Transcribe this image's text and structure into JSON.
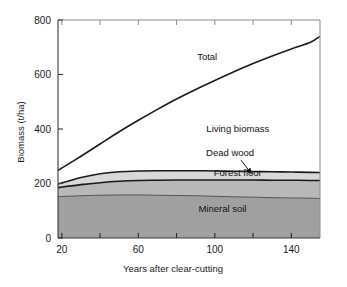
{
  "chart_data": {
    "type": "area",
    "title": "",
    "subtitle": "",
    "xlabel": "Years after clear-cutting",
    "ylabel": "Biomass (t/ha)",
    "xlim": [
      18,
      155
    ],
    "ylim": [
      0,
      800
    ],
    "grid": false,
    "legend_position": "inline-annotations",
    "x_ticks_major": [
      20,
      60,
      100,
      140
    ],
    "x_ticks_minor": [
      40,
      80,
      120
    ],
    "x_tick_labels": [
      "20",
      "60",
      "100",
      "140"
    ],
    "y_ticks_major": [
      0,
      200,
      400,
      600,
      800
    ],
    "y_tick_labels": [
      "0",
      "200",
      "400",
      "600",
      "800"
    ],
    "x": [
      18,
      30,
      40,
      50,
      60,
      70,
      80,
      90,
      100,
      110,
      120,
      130,
      140,
      150,
      155
    ],
    "series": [
      {
        "name": "Mineral soil",
        "label": "Mineral soil",
        "color": "#a0a0a0",
        "stacked": true,
        "values": [
          152,
          155,
          157,
          158,
          158,
          157,
          156,
          155,
          153,
          151,
          150,
          148,
          147,
          146,
          145
        ]
      },
      {
        "name": "Forest floor",
        "label": "Forest floor",
        "color": "#b8b8b8",
        "stacked": true,
        "cumulative": [
          185,
          196,
          203,
          208,
          211,
          212,
          213,
          213,
          213,
          213,
          213,
          212,
          212,
          211,
          211
        ],
        "values": [
          33,
          41,
          46,
          50,
          53,
          55,
          57,
          58,
          60,
          62,
          63,
          64,
          65,
          65,
          66
        ]
      },
      {
        "name": "Dead wood",
        "label": "Dead wood",
        "color": "#d8d8d8",
        "stacked": true,
        "cumulative": [
          198,
          222,
          236,
          243,
          246,
          247,
          247,
          247,
          246,
          245,
          244,
          243,
          242,
          241,
          240
        ],
        "values": [
          13,
          26,
          33,
          35,
          35,
          35,
          34,
          34,
          33,
          32,
          31,
          31,
          30,
          30,
          29
        ]
      },
      {
        "name": "Living biomass",
        "label": "Living biomass",
        "color": "#ffffff",
        "stacked": true,
        "cumulative": [
          248,
          300,
          345,
          390,
          432,
          472,
          510,
          545,
          578,
          610,
          640,
          668,
          694,
          718,
          740
        ],
        "values": [
          50,
          78,
          109,
          147,
          186,
          225,
          263,
          298,
          332,
          365,
          396,
          425,
          452,
          477,
          500
        ]
      }
    ],
    "total_curve": {
      "name": "Total",
      "label": "Total",
      "values": [
        248,
        300,
        345,
        390,
        432,
        472,
        510,
        545,
        578,
        610,
        640,
        668,
        694,
        718,
        740
      ]
    },
    "annotations": [
      {
        "text": "Total",
        "x": 96,
        "y": 655
      },
      {
        "text": "Living biomass",
        "x": 112,
        "y": 390
      },
      {
        "text": "Dead wood",
        "x": 108,
        "y": 300,
        "arrow": true
      },
      {
        "text": "Forest floor",
        "x": 112,
        "y": 228
      },
      {
        "text": "Mineral soil",
        "x": 104,
        "y": 95
      }
    ]
  }
}
